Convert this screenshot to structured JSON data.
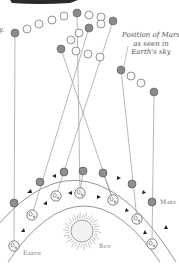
{
  "caption": {
    "line1": "Position of Mars",
    "line2": "as seen in",
    "line3": "Earth's sky"
  },
  "labels": {
    "mars": "Mars",
    "sun": "Sun",
    "earth": "Earth",
    "left_edge_fragment": "y."
  },
  "colors": {
    "observed_dot": "#8a8a8a",
    "path_dot": "#ffffff",
    "line": "#777777",
    "orbit": "#666666"
  },
  "sky_path": [
    {
      "x": 15,
      "y": 33,
      "observed": true
    },
    {
      "x": 27,
      "y": 29,
      "observed": false
    },
    {
      "x": 39,
      "y": 24,
      "observed": false
    },
    {
      "x": 52,
      "y": 20,
      "observed": false
    },
    {
      "x": 64,
      "y": 16,
      "observed": false
    },
    {
      "x": 77,
      "y": 13,
      "observed": true
    },
    {
      "x": 89,
      "y": 15,
      "observed": false
    },
    {
      "x": 101,
      "y": 17,
      "observed": false
    },
    {
      "x": 113,
      "y": 21,
      "observed": true
    },
    {
      "x": 101,
      "y": 24,
      "observed": false
    },
    {
      "x": 89,
      "y": 28,
      "observed": true
    },
    {
      "x": 79,
      "y": 33,
      "observed": false
    },
    {
      "x": 71,
      "y": 40,
      "observed": false
    },
    {
      "x": 61,
      "y": 49,
      "observed": true
    },
    {
      "x": 76,
      "y": 51,
      "observed": false
    },
    {
      "x": 88,
      "y": 54,
      "observed": false
    },
    {
      "x": 100,
      "y": 57,
      "observed": false
    },
    {
      "x": 121,
      "y": 70,
      "observed": true
    },
    {
      "x": 131,
      "y": 76,
      "observed": false
    },
    {
      "x": 141,
      "y": 83,
      "observed": false
    },
    {
      "x": 154,
      "y": 92,
      "observed": true
    }
  ],
  "mars_positions": [
    {
      "x": 14,
      "y": 203
    },
    {
      "x": 40,
      "y": 182
    },
    {
      "x": 64,
      "y": 172
    },
    {
      "x": 83,
      "y": 171
    },
    {
      "x": 103,
      "y": 173
    },
    {
      "x": 132,
      "y": 184
    },
    {
      "x": 152,
      "y": 202
    }
  ],
  "earth_positions": [
    {
      "x": 14,
      "y": 246
    },
    {
      "x": 32,
      "y": 215
    },
    {
      "x": 56,
      "y": 196
    },
    {
      "x": 80,
      "y": 193
    },
    {
      "x": 113,
      "y": 200
    },
    {
      "x": 137,
      "y": 219
    },
    {
      "x": 152,
      "y": 244
    }
  ]
}
